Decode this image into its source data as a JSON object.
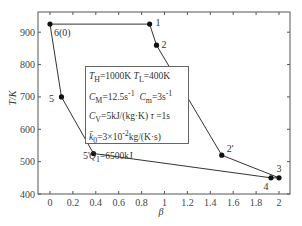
{
  "chart_data": {
    "type": "line",
    "title": "",
    "xlabel": "β",
    "ylabel": "T/K",
    "xlim": [
      -0.1,
      2.1
    ],
    "ylim": [
      400,
      960
    ],
    "xticks": [
      "0",
      "0.2",
      "0.4",
      "0.6",
      "0.8",
      "1",
      "1.2",
      "1.4",
      "1.6",
      "1.8",
      "2"
    ],
    "yticks": [
      "400",
      "500",
      "600",
      "700",
      "800",
      "900"
    ],
    "grid": false,
    "series": [
      {
        "name": "cycle",
        "closed": true,
        "points": [
          {
            "label": "6(0)",
            "x": 0.0,
            "y": 925
          },
          {
            "label": "1",
            "x": 0.87,
            "y": 925
          },
          {
            "label": "2",
            "x": 0.93,
            "y": 860
          },
          {
            "label": "2'",
            "x": 1.5,
            "y": 520
          },
          {
            "label": "3",
            "x": 2.0,
            "y": 450
          },
          {
            "label": "4",
            "x": 1.93,
            "y": 450
          },
          {
            "label": "5'",
            "x": 0.38,
            "y": 525
          },
          {
            "label": "5",
            "x": 0.1,
            "y": 700
          }
        ]
      }
    ],
    "annotations": [
      "T_H=1000K  T_L=400K",
      "C_M=12.5s⁻¹  C_m=3s⁻¹",
      "C_V=5kJ/(kg·K)  τ=1s",
      "k̄_0=3×10⁻²kg/(K·s)",
      "Q_1=6500kJ"
    ]
  },
  "legend": {
    "line1": "T",
    "line1_sub1": "H",
    "line1_val1": "=1000K  ",
    "line1_b": "T",
    "line1_sub2": "L",
    "line1_val2": "=400K",
    "line2_a": "C",
    "line2_sub1": "M",
    "line2_val1": "=12.5s",
    "line2_sup1": "-1",
    "line2_b": "C",
    "line2_sub2": "m",
    "line2_val2": "=3s",
    "line2_sup2": "-1",
    "line3_a": "C",
    "line3_sub": "V",
    "line3_val": "=5kJ/(kg·K)  ",
    "line3_tau": "τ",
    "line3_tauval": " =1s",
    "line4_a": "k̄",
    "line4_sub": "0",
    "line4_val": "=3×10",
    "line4_sup": "-2",
    "line4_val2": "kg/(K·s)",
    "line5_a": "Q",
    "line5_sub": "1",
    "line5_val": "=6500kJ"
  }
}
